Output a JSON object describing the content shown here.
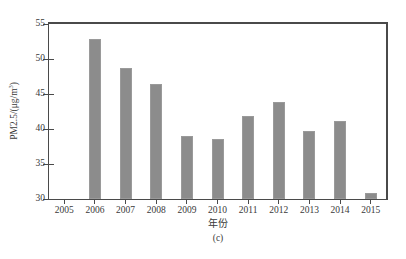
{
  "chart_data": {
    "type": "bar",
    "title": "",
    "subtitle": "",
    "xlabel": "年份",
    "ylabel": "PM2.5/(μg/m³)",
    "ylabel_prefix": "PM2.5/(μg/m",
    "ylabel_sup": "3",
    "ylabel_suffix": ")",
    "caption": "(c)",
    "categories": [
      "2005",
      "2006",
      "2007",
      "2008",
      "2009",
      "2010",
      "2011",
      "2012",
      "2013",
      "2014",
      "2015"
    ],
    "values": [
      null,
      52.8,
      48.7,
      46.4,
      39.0,
      38.6,
      41.8,
      43.8,
      39.7,
      41.2,
      30.8
    ],
    "ylim": [
      30,
      55
    ],
    "yticks": [
      30,
      35,
      40,
      45,
      50,
      55
    ],
    "ytick_labels": [
      "30",
      "35",
      "40",
      "45",
      "50",
      "55"
    ],
    "xtick_labels": [
      "2005",
      "2006",
      "2007",
      "2008",
      "2009",
      "2010",
      "2011",
      "2012",
      "2013",
      "2014",
      "2015"
    ],
    "grid": false,
    "legend": null,
    "bar_color": "#8c8c8c",
    "axis_color": "#4a4a4a",
    "background": "#ffffff"
  }
}
